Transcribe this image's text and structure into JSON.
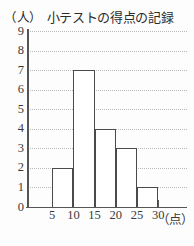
{
  "chart_data": {
    "type": "bar",
    "title": "小テストの得点の記録",
    "xlabel": "（点）",
    "ylabel": "（人）",
    "categories": [
      "5-10",
      "10-15",
      "15-20",
      "20-25",
      "25-30"
    ],
    "values": [
      2,
      7,
      4,
      3,
      1
    ],
    "bin_edges": [
      5,
      10,
      15,
      20,
      25,
      30
    ],
    "x_tick_labels": [
      "5",
      "10",
      "15",
      "20",
      "25",
      "30"
    ],
    "y_tick_labels": [
      "0",
      "1",
      "2",
      "3",
      "4",
      "5",
      "6",
      "7",
      "8",
      "9"
    ],
    "ylim": [
      0,
      9
    ],
    "xlim": [
      0,
      35
    ],
    "grid": true,
    "grid_style": "dotted",
    "legend": "none",
    "colors": {
      "bar_fill": "#ffffff",
      "bar_edge": "#4a4a4a",
      "axis": "#555555",
      "grid": "#b9b9b9",
      "text": "#2b2b2b",
      "background": "#fdfdfd"
    }
  }
}
